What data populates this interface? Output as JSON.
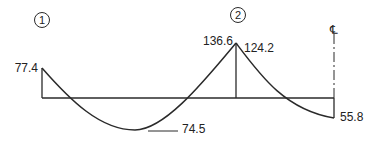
{
  "diagram": {
    "type": "bending-moment-diagram",
    "colors": {
      "line": "#2a2a2a",
      "text": "#222222",
      "background": "#ffffff"
    },
    "supports": [
      {
        "id": "support-1",
        "label": "1"
      },
      {
        "id": "support-2",
        "label": "2"
      }
    ],
    "centerline_symbol": "℄",
    "values": {
      "left_end_moment": "77.4",
      "span_min_moment": "74.5",
      "support2_left_moment": "136.6",
      "support2_right_moment": "124.2",
      "centerline_moment": "55.8"
    }
  }
}
